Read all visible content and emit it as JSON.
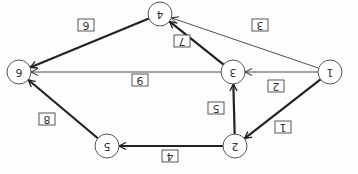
{
  "diagram": {
    "orientation": "rotated-180",
    "nodes": [
      {
        "id": "1",
        "label": "1",
        "x": 330,
        "y": 72
      },
      {
        "id": "2",
        "label": "2",
        "x": 235,
        "y": 146
      },
      {
        "id": "3",
        "label": "3",
        "x": 233,
        "y": 72
      },
      {
        "id": "4",
        "label": "4",
        "x": 160,
        "y": 14
      },
      {
        "id": "5",
        "label": "5",
        "x": 107,
        "y": 146
      },
      {
        "id": "6",
        "label": "6",
        "x": 19,
        "y": 72
      }
    ],
    "edges": [
      {
        "from": "1",
        "to": "2",
        "weight": "1",
        "bold": true,
        "lx": 283,
        "ly": 127
      },
      {
        "from": "1",
        "to": "3",
        "weight": "2",
        "bold": false,
        "lx": 276,
        "ly": 86
      },
      {
        "from": "1",
        "to": "4",
        "weight": "3",
        "bold": false,
        "lx": 260,
        "ly": 25
      },
      {
        "from": "2",
        "to": "3",
        "weight": "5",
        "bold": true,
        "lx": 216,
        "ly": 108
      },
      {
        "from": "2",
        "to": "5",
        "weight": "4",
        "bold": true,
        "lx": 170,
        "ly": 156
      },
      {
        "from": "3",
        "to": "4",
        "weight": "7",
        "bold": true,
        "lx": 182,
        "ly": 41
      },
      {
        "from": "3",
        "to": "6",
        "weight": "9",
        "bold": false,
        "lx": 140,
        "ly": 80
      },
      {
        "from": "4",
        "to": "6",
        "weight": "6",
        "bold": true,
        "lx": 86,
        "ly": 25
      },
      {
        "from": "5",
        "to": "6",
        "weight": "8",
        "bold": true,
        "lx": 47,
        "ly": 119
      }
    ]
  }
}
